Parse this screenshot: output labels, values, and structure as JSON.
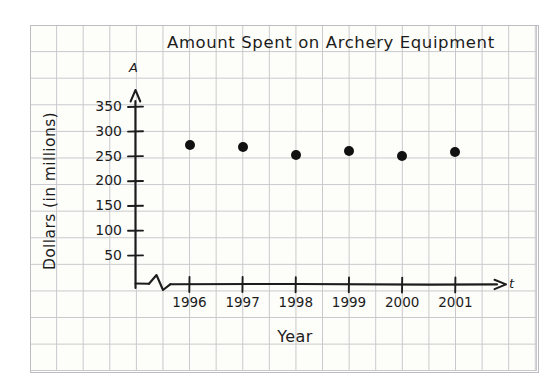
{
  "chart_data": {
    "type": "scatter",
    "title": "Amount Spent on Archery Equipment",
    "xlabel": "Year",
    "ylabel": "Dollars (in millions)",
    "x_axis_variable": "t",
    "y_axis_variable": "A",
    "categories": [
      "1996",
      "1997",
      "1998",
      "1999",
      "2000",
      "2001"
    ],
    "x": [
      1996,
      1997,
      1998,
      1999,
      2000,
      2001
    ],
    "values": [
      273,
      268,
      253,
      260,
      250,
      258
    ],
    "series": [
      {
        "name": "Amount Spent",
        "values": [
          273,
          268,
          253,
          260,
          250,
          258
        ]
      }
    ],
    "ylim": [
      0,
      360
    ],
    "xlim": [
      1995.4,
      2001.9
    ],
    "ytick_labels": [
      "50",
      "100",
      "150",
      "200",
      "250",
      "300",
      "350"
    ],
    "ytick_values": [
      50,
      100,
      150,
      200,
      250,
      300,
      350
    ],
    "xtick_labels": [
      "1996",
      "1997",
      "1998",
      "1999",
      "2000",
      "2001"
    ],
    "grid": true,
    "legend": false,
    "legend_position": "none",
    "axis_break": "x-axis zigzag break near origin",
    "marker": "filled-circle",
    "marker_color": "#111111",
    "style": "hand-drawn on graph paper"
  },
  "colors": {
    "ink": "#1c1c1c",
    "grid_line": "#c9c9cd",
    "paper": "#fdfdfa",
    "page": "#ffffff",
    "marker": "#111111"
  }
}
